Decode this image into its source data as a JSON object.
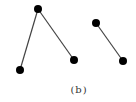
{
  "figure": {
    "caption": "(b)",
    "colors": {
      "node": "#000000",
      "edge": "#444444",
      "background": "#ffffff"
    },
    "node_radius": 4,
    "edge_width": 1.2,
    "graphs": [
      {
        "name": "left-tree",
        "nodes": [
          {
            "id": "A",
            "x": 38,
            "y": 9
          },
          {
            "id": "B",
            "x": 20,
            "y": 70
          },
          {
            "id": "C",
            "x": 74,
            "y": 60
          }
        ],
        "edges": [
          {
            "from": "A",
            "to": "B"
          },
          {
            "from": "A",
            "to": "C"
          }
        ]
      },
      {
        "name": "right-pair",
        "nodes": [
          {
            "id": "D",
            "x": 96,
            "y": 23
          },
          {
            "id": "E",
            "x": 123,
            "y": 61
          }
        ],
        "edges": [
          {
            "from": "D",
            "to": "E"
          }
        ]
      }
    ]
  }
}
